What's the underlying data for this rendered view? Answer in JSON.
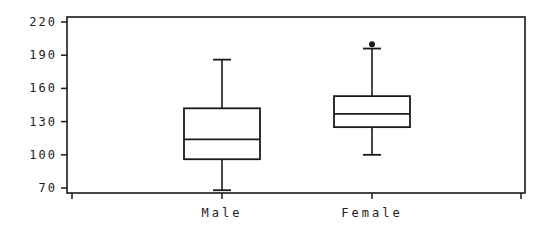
{
  "chart_data": {
    "type": "boxplot",
    "title": "",
    "xlabel": "",
    "ylabel": "",
    "ylim": [
      66,
      224
    ],
    "yticks": [
      70,
      100,
      130,
      160,
      190,
      220
    ],
    "categories": [
      "Male",
      "Female"
    ],
    "series": [
      {
        "name": "Male",
        "whisker_low": 68,
        "q1": 96,
        "median": 114,
        "q3": 142,
        "whisker_high": 186,
        "outliers": []
      },
      {
        "name": "Female",
        "whisker_low": 100,
        "q1": 125,
        "median": 137,
        "q3": 153,
        "whisker_high": 196,
        "outliers": [
          200
        ]
      }
    ],
    "grid": false,
    "legend": null
  },
  "colors": {
    "line": "#1a1a1a",
    "background": "#ffffff"
  }
}
